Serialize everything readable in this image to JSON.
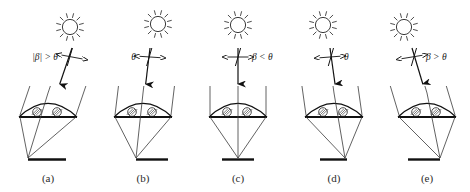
{
  "figure": {
    "name": "solar-incidence-angle-diagram",
    "colors": {
      "ink": "#1a1a1a",
      "ray": "#3a3a3a",
      "background": "#ffffff"
    },
    "panels": [
      {
        "id": "a",
        "caption": "(a)",
        "angle_label": "|β| > θ",
        "label_side": "left",
        "sun_x": 70,
        "sun_y": 27,
        "beam_x": 72,
        "beam_tilt": -0.34,
        "focus_x": 28,
        "ground_x1": 28,
        "ground_x2": 66,
        "lens_cx": 48
      },
      {
        "id": "b",
        "caption": "(b)",
        "angle_label": "θ",
        "label_side": "left",
        "sun_x": 158,
        "sun_y": 24,
        "beam_x": 150,
        "beam_tilt": -0.12,
        "focus_x": 136,
        "ground_x1": 136,
        "ground_x2": 168,
        "lens_cx": 143
      },
      {
        "id": "c",
        "caption": "(c)",
        "angle_label": "β < θ",
        "label_side": "right",
        "sun_x": 238,
        "sun_y": 25,
        "beam_x": 238,
        "beam_tilt": 0,
        "focus_x": 238,
        "ground_x1": 222,
        "ground_x2": 254,
        "lens_cx": 238
      },
      {
        "id": "d",
        "caption": "(d)",
        "angle_label": "θ",
        "label_side": "right",
        "sun_x": 323,
        "sun_y": 25,
        "beam_x": 330,
        "beam_tilt": 0.14,
        "focus_x": 345,
        "ground_x1": 320,
        "ground_x2": 347,
        "lens_cx": 334
      },
      {
        "id": "e",
        "caption": "(e)",
        "angle_label": "β > θ",
        "label_side": "right",
        "sun_x": 404,
        "sun_y": 27,
        "beam_x": 412,
        "beam_tilt": 0.3,
        "focus_x": 440,
        "ground_x1": 408,
        "ground_x2": 440,
        "lens_cx": 427
      }
    ]
  }
}
